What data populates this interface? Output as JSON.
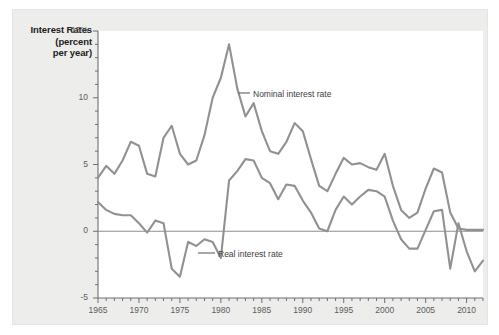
{
  "figure": {
    "axis_title_lines": [
      "Interest Rates",
      "(percent",
      "per year)"
    ],
    "background_color": "#ededec",
    "plot_background_color": "#ffffff",
    "line_color": "#919191",
    "axis_color": "#6e6e6e"
  },
  "legend": {
    "nominal_label": "Nominal interest rate",
    "real_label": "Real interest rate"
  },
  "chart_data": {
    "type": "line",
    "title": "Interest Rates (percent per year)",
    "xlabel": "",
    "ylabel": "Interest Rates (percent per year)",
    "xlim": [
      1965,
      2012
    ],
    "ylim": [
      -5,
      15
    ],
    "yticks": [
      -5,
      0,
      5,
      10,
      15
    ],
    "ytick_labels": [
      "-5",
      "0",
      "5",
      "10",
      "15%"
    ],
    "y_minor_tick_step": 1,
    "xticks": [
      1965,
      1970,
      1975,
      1980,
      1985,
      1990,
      1995,
      2000,
      2005,
      2010
    ],
    "xtick_labels": [
      "1965",
      "1970",
      "1975",
      "1980",
      "1985",
      "1990",
      "1995",
      "2000",
      "2005",
      "2010"
    ],
    "x_minor_tick_step": 1,
    "grid": false,
    "zero_line": 0,
    "legend_position": "inline-annotations",
    "x": [
      1965,
      1966,
      1967,
      1968,
      1969,
      1970,
      1971,
      1972,
      1973,
      1974,
      1975,
      1976,
      1977,
      1978,
      1979,
      1980,
      1981,
      1982,
      1983,
      1984,
      1985,
      1986,
      1987,
      1988,
      1989,
      1990,
      1991,
      1992,
      1993,
      1994,
      1995,
      1996,
      1997,
      1998,
      1999,
      2000,
      2001,
      2002,
      2003,
      2004,
      2005,
      2006,
      2007,
      2008,
      2009,
      2010,
      2011,
      2012
    ],
    "series": [
      {
        "name": "Nominal interest rate",
        "values": [
          4.0,
          4.9,
          4.3,
          5.3,
          6.7,
          6.4,
          4.3,
          4.1,
          7.0,
          7.9,
          5.8,
          5.0,
          5.3,
          7.2,
          10.0,
          11.5,
          14.0,
          10.7,
          8.6,
          9.6,
          7.5,
          6.0,
          5.8,
          6.7,
          8.1,
          7.5,
          5.4,
          3.4,
          3.0,
          4.3,
          5.5,
          5.0,
          5.1,
          4.8,
          4.6,
          5.8,
          3.4,
          1.6,
          1.0,
          1.4,
          3.2,
          4.7,
          4.4,
          1.4,
          0.2,
          0.1,
          0.1,
          0.1
        ]
      },
      {
        "name": "Real interest rate",
        "values": [
          2.2,
          1.6,
          1.3,
          1.2,
          1.2,
          0.6,
          -0.1,
          0.8,
          0.6,
          -2.8,
          -3.4,
          -0.8,
          -1.1,
          -0.6,
          -0.8,
          -2.0,
          3.8,
          4.5,
          5.4,
          5.3,
          4.0,
          3.6,
          2.4,
          3.5,
          3.4,
          2.3,
          1.4,
          0.2,
          0.0,
          1.6,
          2.6,
          2.0,
          2.6,
          3.1,
          3.0,
          2.6,
          0.8,
          -0.6,
          -1.3,
          -1.3,
          0.1,
          1.5,
          1.6,
          -2.8,
          0.6,
          -1.5,
          -3.0,
          -2.2
        ]
      }
    ]
  }
}
